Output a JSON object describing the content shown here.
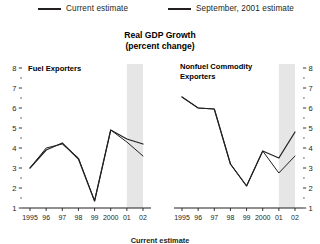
{
  "legend": {
    "items": [
      {
        "label": "Current estimate",
        "color": "#231f20"
      },
      {
        "label": "September, 2001 estimate",
        "color": "#231f20"
      }
    ]
  },
  "title": {
    "line1": "Real GDP Growth",
    "line2": "(percent change)"
  },
  "footnote": "Current estimate",
  "chart_data": [
    {
      "type": "line",
      "title": "Fuel Exporters",
      "xlabel": "",
      "ylabel": "",
      "x": [
        "1995",
        "96",
        "97",
        "98",
        "99",
        "2000",
        "01",
        "02"
      ],
      "xticklabels": [
        "1995",
        "96",
        "97",
        "98",
        "99",
        "2000",
        "01",
        "02"
      ],
      "yticklabels": [
        "1",
        "2",
        "3",
        "4",
        "5",
        "6",
        "7",
        "8"
      ],
      "ylim": [
        1,
        8
      ],
      "grid": false,
      "legend_position": "top",
      "axis_side": "left",
      "shaded_region": {
        "from": "01",
        "to": "02",
        "color": "#e6e6e6"
      },
      "series": [
        {
          "name": "Current estimate",
          "values": [
            3.0,
            3.9,
            4.25,
            3.45,
            1.35,
            4.9,
            4.45,
            4.2
          ]
        },
        {
          "name": "September, 2001 estimate",
          "values": [
            3.0,
            4.0,
            4.2,
            3.5,
            1.35,
            4.9,
            4.3,
            3.6
          ]
        }
      ]
    },
    {
      "type": "line",
      "title": "Nonfuel Commodity Exporters",
      "xlabel": "",
      "ylabel": "",
      "x": [
        "1995",
        "96",
        "97",
        "98",
        "99",
        "2000",
        "01",
        "02"
      ],
      "xticklabels": [
        "1995",
        "96",
        "97",
        "98",
        "99",
        "2000",
        "01",
        "02"
      ],
      "yticklabels": [
        "1",
        "2",
        "3",
        "4",
        "5",
        "6",
        "7",
        "8"
      ],
      "ylim": [
        1,
        8
      ],
      "grid": false,
      "legend_position": "top",
      "axis_side": "right",
      "shaded_region": {
        "from": "01",
        "to": "02",
        "color": "#e6e6e6"
      },
      "series": [
        {
          "name": "Current estimate",
          "values": [
            6.55,
            6.0,
            5.95,
            3.2,
            2.1,
            3.85,
            3.5,
            4.8
          ]
        },
        {
          "name": "September, 2001 estimate",
          "values": [
            6.55,
            6.0,
            5.95,
            3.2,
            2.1,
            3.85,
            2.75,
            3.6
          ]
        }
      ]
    }
  ]
}
